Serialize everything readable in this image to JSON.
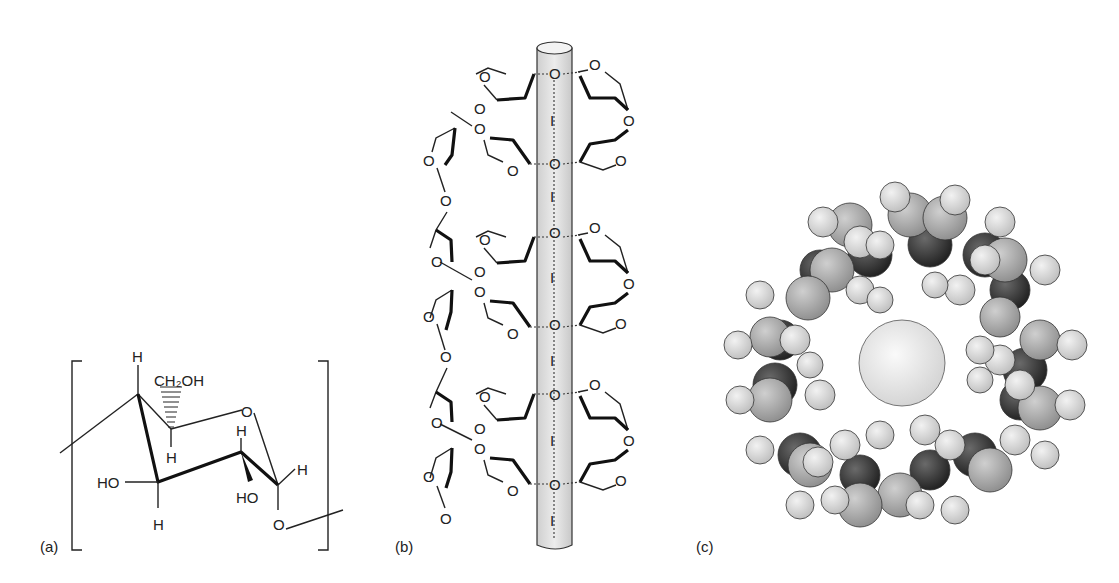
{
  "figure": {
    "panels": [
      {
        "id": "a",
        "label": "(a)",
        "description": "Glucose repeat unit (amylose) chair structure",
        "atoms": {
          "h_top": "H",
          "ch2oh": "CH₂OH",
          "ring_o": "O",
          "h_c1": "H",
          "h_right": "H",
          "h_mid": "H",
          "ho_left": "HO",
          "ho_right": "HO",
          "h_bottom": "H",
          "o_link": "O"
        }
      },
      {
        "id": "b",
        "label": "(b)",
        "description": "Amylose helix with iodine chain in cylinder",
        "ring_o": "O",
        "iodine": "I",
        "center_o": "O"
      },
      {
        "id": "c",
        "label": "(c)",
        "description": "Space-filling model of helix cross-section with central iodine"
      }
    ],
    "colors": {
      "ink": "#222222",
      "cylinder_fill": "#dcdcdc",
      "atom_light": "#d6d6d6",
      "atom_mid": "#a9a9a9",
      "atom_dark": "#3a3a3a",
      "iodine_sphere": "#e6e6e6"
    }
  }
}
